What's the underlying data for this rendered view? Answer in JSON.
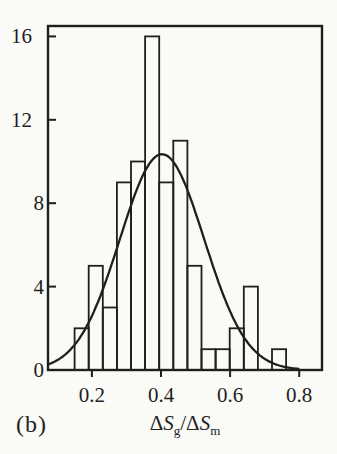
{
  "chart_data": {
    "type": "bar",
    "subtype": "histogram",
    "panel_label": "(b)",
    "xlabel_text": "ΔSg/ΔSm",
    "xlabel": {
      "parts": [
        {
          "delta": "Δ",
          "symbol": "S",
          "sub": "g"
        },
        {
          "delta": "Δ",
          "symbol": "S",
          "sub": "m"
        }
      ],
      "separator": "/"
    },
    "bins": {
      "start": 0.15,
      "width": 0.0408
    },
    "counts": [
      2,
      5,
      3,
      9,
      10,
      16,
      9,
      11,
      5,
      1,
      1,
      2,
      4,
      0,
      1
    ],
    "x_tick_labels": [
      "0.2",
      "0.4",
      "0.6",
      "0.8"
    ],
    "x_tick_values": [
      0.2,
      0.4,
      0.6,
      0.8
    ],
    "y_tick_labels": [
      "0",
      "4",
      "8",
      "12",
      "16"
    ],
    "y_tick_values": [
      0,
      4,
      8,
      12,
      16
    ],
    "xlim": [
      0.073,
      0.866
    ],
    "ylim": [
      0,
      16.5
    ],
    "grid": false,
    "legend": null,
    "bar_fill": "none",
    "fit_curve": {
      "shape": "gaussian",
      "amplitude": 10.35,
      "mean": 0.403,
      "sigma": 0.122
    },
    "colors": {
      "line": "#1f1f1f",
      "background": "#fafaf7"
    }
  }
}
